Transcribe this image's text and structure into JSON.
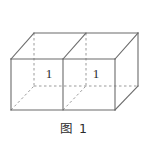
{
  "figure": {
    "caption": "图 1",
    "kind": "solid-geometry-diagram",
    "shape": "rectangular box composed of two unit cubes side by side",
    "projection": "oblique",
    "stroke_color": "#6b6b6b",
    "hidden_stroke_color": "#9a9a9a",
    "background_color": "#ffffff",
    "label_color": "#2b2b2b",
    "face_labels": [
      {
        "id": "front-left-face-length",
        "text": "1",
        "x": 49,
        "y": 74
      },
      {
        "id": "front-right-face-length",
        "text": "1",
        "x": 96,
        "y": 74
      }
    ],
    "vertices": {
      "front_bottom_left": [
        11,
        110
      ],
      "front_bottom_mid": [
        63,
        110
      ],
      "front_bottom_right": [
        115,
        110
      ],
      "front_top_left": [
        11,
        59
      ],
      "front_top_mid": [
        63,
        59
      ],
      "front_top_right": [
        115,
        59
      ],
      "back_bottom_left": [
        34,
        86
      ],
      "back_bottom_mid": [
        86,
        86
      ],
      "back_bottom_right": [
        138,
        86
      ],
      "back_top_left": [
        34,
        33
      ],
      "back_top_mid": [
        86,
        33
      ],
      "back_top_right": [
        138,
        33
      ]
    },
    "visible_edges": [
      "front-bottom-left-to-front-bottom-right",
      "front-top-left-to-front-top-right",
      "front-left-vertical",
      "front-mid-vertical",
      "front-right-vertical",
      "back-top-left-to-back-top-right",
      "back-top-right-vertical-to-back-bottom-right",
      "front-top-left-to-back-top-left-diagonal",
      "front-top-mid-to-back-top-mid-diagonal",
      "front-top-right-to-back-top-right-diagonal",
      "front-bottom-right-to-back-bottom-right-diagonal"
    ],
    "hidden_edges": [
      "back-bottom-left-to-back-bottom-right-dashed",
      "back-top-left-vertical-to-back-bottom-left-dashed",
      "back-top-mid-vertical-to-back-bottom-mid-dashed",
      "front-bottom-left-to-back-bottom-left-dashed",
      "front-bottom-mid-to-back-bottom-mid-dashed"
    ]
  }
}
